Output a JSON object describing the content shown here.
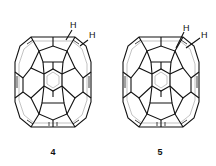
{
  "figure": {
    "molecules": [
      {
        "id": "4",
        "label": "4",
        "substituents": [
          "H",
          "H"
        ],
        "description": "1,2-dihydrofullerene C60H2 (adjacent 6,6-bond)"
      },
      {
        "id": "5",
        "label": "5",
        "substituents": [
          "H",
          "H"
        ],
        "description": "1,4-dihydrofullerene C60H2 isomer"
      }
    ],
    "colors": {
      "line": "#111111",
      "inner_line": "#999999",
      "background": "#ffffff"
    }
  }
}
